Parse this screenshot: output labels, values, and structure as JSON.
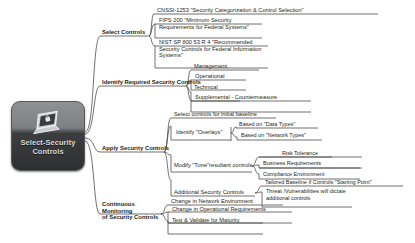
{
  "diagram": {
    "title": "Select-Security Controls",
    "type": "mind-map",
    "center": {
      "label_line1": "Select-Security",
      "label_line2": "Controls",
      "icon": "laptop-lock-icon"
    },
    "branches": [
      {
        "id": "select-controls",
        "label": "Select Controls",
        "children": [
          {
            "id": "cnssi-1253",
            "label": "CNSSI-1253 \"Security Categorization & Control Selection\""
          },
          {
            "id": "fips-200",
            "label": "FIPS 200 \"Minimum Security Requirements for Federal Systems\""
          },
          {
            "id": "nist-sp-800-53",
            "label": "NIST SP 800 53 R 4 \"Recommended Security Controls for Federal Information Systems\""
          }
        ]
      },
      {
        "id": "identify-required-security-controls",
        "label": "Identify Required Security Controls",
        "children": [
          {
            "id": "management",
            "label": "Management"
          },
          {
            "id": "operational",
            "label": "Operational"
          },
          {
            "id": "technical",
            "label": "Technical"
          },
          {
            "id": "supplemental-countermeasure",
            "label": "Supplemental - Countermeasure"
          }
        ]
      },
      {
        "id": "apply-security-controls",
        "label": "Apply Security Controls",
        "children": [
          {
            "id": "select-controls-initial-baseline",
            "label": "Select controls for initial baseline",
            "children": []
          },
          {
            "id": "identify-overlays",
            "label": "Identify \"Overlays\"",
            "children": [
              {
                "id": "based-on-data-types",
                "label": "Based on \"Data Types\""
              },
              {
                "id": "based-on-network-types",
                "label": "Based on \"Network Types\""
              }
            ]
          },
          {
            "id": "modify-tune-resultant-controls",
            "label": "Modify \"Tune\"resultant controls",
            "children": [
              {
                "id": "risk-tolerance",
                "label": "Risk Tolerance"
              },
              {
                "id": "business-requirements",
                "label": "Business Requirements"
              },
              {
                "id": "compliance-environment",
                "label": "Compliance Environment"
              }
            ]
          },
          {
            "id": "additional-security-controls",
            "label": "Additional Security Controls",
            "children": [
              {
                "id": "tailored-baseline",
                "label": "Tailored Baseline if Controls \"Starting Point\""
              },
              {
                "id": "threat-vulnerabilities",
                "label": "Threat /Vulnerabilities will dictate additional controls"
              }
            ]
          }
        ]
      },
      {
        "id": "continuous-monitoring",
        "label_line1": "Continuous Monitoring",
        "label_line2": "of Security Controls",
        "children": [
          {
            "id": "change-network-environment",
            "label": "Change in Network Environment"
          },
          {
            "id": "change-operational-requirements",
            "label": "Change in Operational Requirements"
          },
          {
            "id": "test-validate-maturity",
            "label": "Test & Validate for Maturity"
          }
        ]
      }
    ],
    "colors": {
      "line": "#4b4b4b",
      "text": "#231f20",
      "center_dark": "#2e3032",
      "center_light": "#8f9194",
      "background": "#ffffff"
    }
  }
}
